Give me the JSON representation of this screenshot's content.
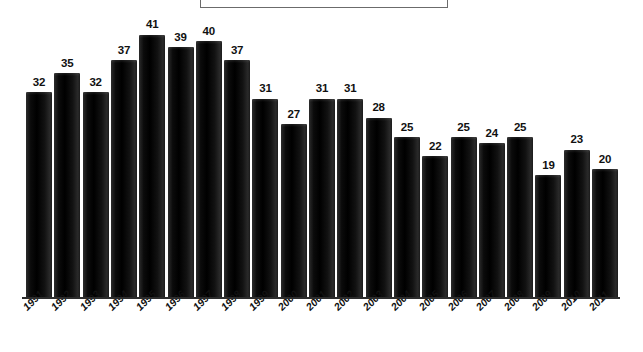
{
  "chart_data": {
    "type": "bar",
    "title": "",
    "subtitle": "",
    "xlabel": "",
    "ylabel": "",
    "categories": [
      "1991",
      "1992",
      "1993",
      "1994",
      "1995",
      "1996",
      "1997",
      "1998",
      "1999",
      "2000",
      "2001",
      "2002",
      "2003",
      "2004",
      "2005",
      "2006",
      "2007",
      "2008",
      "2009",
      "2010",
      "2011"
    ],
    "values": [
      32,
      35,
      32,
      37,
      41,
      39,
      40,
      37,
      31,
      27,
      31,
      31,
      28,
      25,
      22,
      25,
      24,
      25,
      19,
      23,
      20
    ],
    "data_labels": [
      "32",
      "35",
      "32",
      "37",
      "41",
      "39",
      "40",
      "37",
      "31",
      "27",
      "31",
      "31",
      "28",
      "25",
      "22",
      "25",
      "24",
      "25",
      "19",
      "23",
      "20"
    ],
    "ylim": [
      0,
      46
    ],
    "grid": false,
    "legend": {
      "present": true,
      "position": "top-center",
      "entries": [],
      "note": "empty legend frame, clipped by top edge of image"
    },
    "axis": {
      "x_axis_visible": true,
      "y_axis_visible": false,
      "y_tick_labels": []
    },
    "colors": {
      "bar": "#151515",
      "bar_highlight": "#2c2c2c",
      "text": "#111111",
      "axis": "#2d2d2d",
      "legend_border": "#6b6b6b",
      "background": "#ffffff"
    }
  }
}
